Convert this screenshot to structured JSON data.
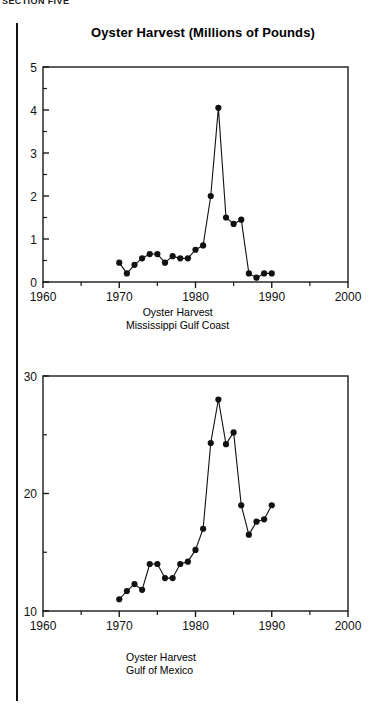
{
  "running_head": "SECTION FIVE",
  "title": "Oyster Harvest (Millions of Pounds)",
  "figures": [
    {
      "id": "mississippi-gulf-coast",
      "caption_line1": "Oyster Harvest",
      "caption_line2": "Mississippi Gulf Coast",
      "y_tick_labels": [
        "5",
        "4",
        "3",
        "2",
        "1",
        "0"
      ],
      "x_tick_labels": [
        "1960",
        "1970",
        "1980",
        "1990",
        "2000"
      ]
    },
    {
      "id": "gulf-of-mexico",
      "caption_line1": "Oyster Harvest",
      "caption_line2": "Gulf of Mexico",
      "y_tick_labels": [
        "30",
        "20",
        "10"
      ],
      "x_tick_labels": [
        "1960",
        "1970",
        "1980",
        "1990",
        "2000"
      ]
    }
  ],
  "chart_data": [
    {
      "type": "line",
      "id": "mississippi-gulf-coast",
      "title": "Oyster Harvest (Millions of Pounds)",
      "subtitle": "Oyster Harvest Mississippi Gulf Coast",
      "xlabel": "",
      "ylabel": "",
      "xlim": [
        1960,
        2000
      ],
      "ylim": [
        0,
        5
      ],
      "x_major_ticks": [
        1960,
        1970,
        1980,
        1990,
        2000
      ],
      "x_minor_ticks": [
        1965,
        1975,
        1985,
        1995
      ],
      "y_major_ticks": [
        0,
        1,
        2,
        3,
        4,
        5
      ],
      "y_minor_ticks": [
        0.5,
        1.5,
        2.5,
        3.5,
        4.5
      ],
      "grid": false,
      "legend": "none",
      "marker": "filled-circle",
      "x": [
        1970,
        1971,
        1972,
        1973,
        1974,
        1975,
        1976,
        1977,
        1978,
        1979,
        1980,
        1981,
        1982,
        1983,
        1984,
        1985,
        1986,
        1987,
        1988,
        1989,
        1990
      ],
      "values": [
        0.45,
        0.2,
        0.4,
        0.55,
        0.65,
        0.65,
        0.45,
        0.6,
        0.55,
        0.55,
        0.75,
        0.85,
        2.0,
        4.05,
        1.5,
        1.35,
        1.45,
        0.2,
        0.1,
        0.2,
        0.2
      ]
    },
    {
      "type": "line",
      "id": "gulf-of-mexico",
      "title": "Oyster Harvest (Millions of Pounds)",
      "subtitle": "Oyster Harvest Gulf of Mexico",
      "xlabel": "",
      "ylabel": "",
      "xlim": [
        1960,
        2000
      ],
      "ylim": [
        10,
        30
      ],
      "x_major_ticks": [
        1960,
        1970,
        1980,
        1990,
        2000
      ],
      "x_minor_ticks": [
        1965,
        1975,
        1985,
        1995
      ],
      "y_major_ticks": [
        10,
        20,
        30
      ],
      "y_minor_ticks": [
        15,
        25
      ],
      "grid": false,
      "legend": "none",
      "marker": "filled-circle",
      "x": [
        1970,
        1971,
        1972,
        1973,
        1974,
        1975,
        1976,
        1977,
        1978,
        1979,
        1980,
        1981,
        1982,
        1983,
        1984,
        1985,
        1986,
        1987,
        1988,
        1989,
        1990
      ],
      "values": [
        11.0,
        11.7,
        12.3,
        11.8,
        14.0,
        14.0,
        12.8,
        12.8,
        14.0,
        14.2,
        15.2,
        17.0,
        24.3,
        28.0,
        24.2,
        25.2,
        19.0,
        16.5,
        17.6,
        17.8,
        19.0
      ]
    }
  ]
}
